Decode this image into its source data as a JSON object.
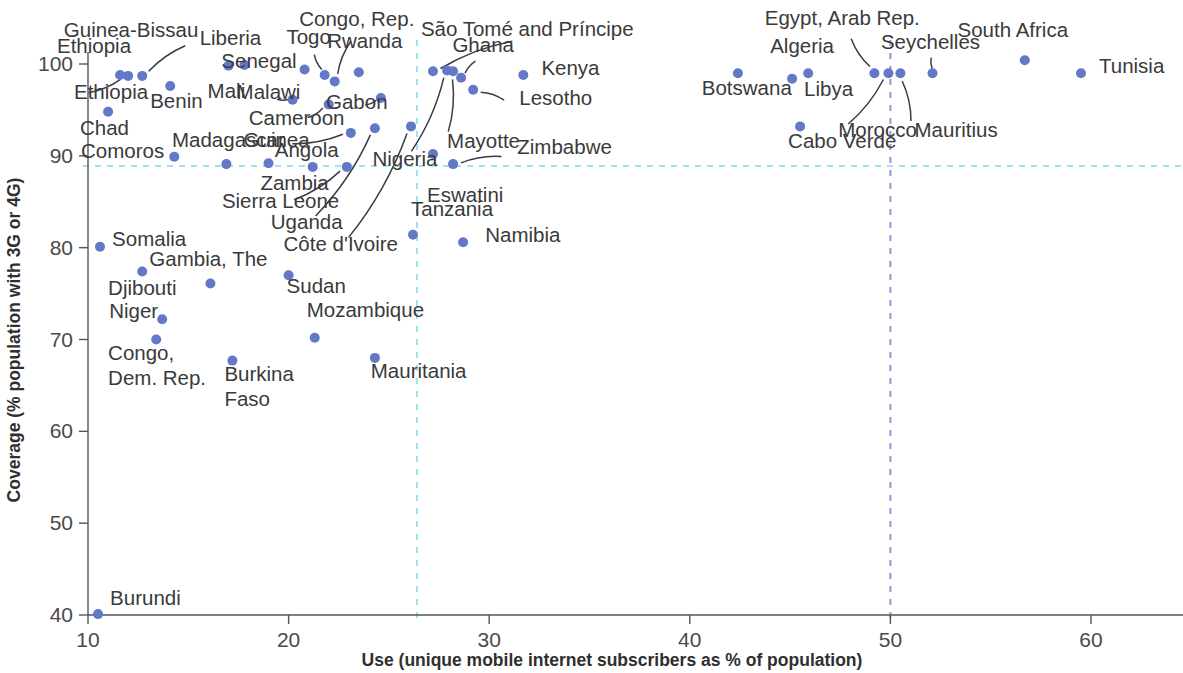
{
  "chart_data": {
    "type": "scatter",
    "title": "",
    "xlabel": "Use (unique mobile internet subscribers as % of population)",
    "ylabel": "Coverage (% population with 3G or 4G)",
    "xlim": [
      9.0,
      65.0
    ],
    "ylim": [
      39.2,
      101.5
    ],
    "xticks": [
      10,
      20,
      30,
      40,
      50,
      60
    ],
    "yticks": [
      40,
      50,
      60,
      70,
      80,
      90,
      100
    ],
    "grid": false,
    "legend": null,
    "marker_color": "#6478c8",
    "reference_lines": [
      {
        "name": "coverage-average",
        "orientation": "horizontal",
        "value": 88.9,
        "color": "#9de2f0",
        "style": "dashed"
      },
      {
        "name": "use-average",
        "orientation": "vertical",
        "value": 26.4,
        "color": "#9de2f0",
        "style": "dashed"
      },
      {
        "name": "use-target",
        "orientation": "vertical",
        "value": 50.0,
        "color": "#8e9ad8",
        "style": "dashed"
      }
    ],
    "points": [
      {
        "label": "Ethiopia",
        "x": 11.6,
        "y": 98.8,
        "lx": 10.3,
        "ly": 101.2,
        "anchor": "mid",
        "leader": false
      },
      {
        "label": "Guinea-Bissau",
        "x": 12.7,
        "y": 98.7,
        "lx": 15.5,
        "ly": 103.0,
        "anchor": "end",
        "leader": true
      },
      {
        "label": "Ethiopia",
        "x": 12.0,
        "y": 98.7,
        "lx": 9.3,
        "ly": 96.2,
        "anchor": "start",
        "leader": true
      },
      {
        "label": "Benin",
        "x": 14.1,
        "y": 97.6,
        "lx": 13.1,
        "ly": 95.2,
        "anchor": "start",
        "leader": false
      },
      {
        "label": "Chad",
        "x": 11.0,
        "y": 94.8,
        "lx": 9.6,
        "ly": 92.3,
        "anchor": "start",
        "leader": false
      },
      {
        "label": "Comoros",
        "x": 14.3,
        "y": 89.9,
        "lx": 13.8,
        "ly": 89.8,
        "anchor": "end",
        "leader": false
      },
      {
        "label": "Madagascar",
        "x": 16.9,
        "y": 89.1,
        "lx": 17.0,
        "ly": 91.0,
        "anchor": "mid",
        "leader": false
      },
      {
        "label": "Liberia",
        "x": 17.0,
        "y": 99.8,
        "lx": 17.1,
        "ly": 102.1,
        "anchor": "mid",
        "leader": false
      },
      {
        "label": "Mali",
        "x": 17.8,
        "y": 99.9,
        "lx": 16.9,
        "ly": 96.3,
        "anchor": "mid",
        "leader": false
      },
      {
        "label": "Senegal",
        "x": 20.8,
        "y": 99.4,
        "lx": 20.4,
        "ly": 99.6,
        "anchor": "end",
        "leader": false
      },
      {
        "label": "Togo",
        "x": 21.8,
        "y": 98.8,
        "lx": 21.0,
        "ly": 102.2,
        "anchor": "mid",
        "leader": true
      },
      {
        "label": "Congo, Rep.",
        "x": 22.3,
        "y": 98.1,
        "lx": 23.4,
        "ly": 104.1,
        "anchor": "mid",
        "leader": true
      },
      {
        "label": "Malawi",
        "x": 20.2,
        "y": 96.1,
        "lx": 19.0,
        "ly": 96.2,
        "anchor": "mid",
        "leader": true
      },
      {
        "label": "Cameroon",
        "x": 22.0,
        "y": 95.6,
        "lx": 20.4,
        "ly": 93.4,
        "anchor": "mid",
        "leader": true
      },
      {
        "label": "Guinea",
        "x": 23.1,
        "y": 92.5,
        "lx": 19.4,
        "ly": 91.0,
        "anchor": "mid",
        "leader": true
      },
      {
        "label": "Angola",
        "x": 19.0,
        "y": 89.2,
        "lx": 20.9,
        "ly": 89.9,
        "anchor": "mid",
        "leader": false
      },
      {
        "label": "Zambia",
        "x": 21.2,
        "y": 88.8,
        "lx": 20.3,
        "ly": 86.3,
        "anchor": "mid",
        "leader": false
      },
      {
        "label": "Sierra Leone",
        "x": 22.9,
        "y": 88.8,
        "lx": 19.6,
        "ly": 84.3,
        "anchor": "mid",
        "leader": true
      },
      {
        "label": "Rwanda",
        "x": 23.5,
        "y": 99.1,
        "lx": 23.8,
        "ly": 101.8,
        "anchor": "mid",
        "leader": false
      },
      {
        "label": "Gabon",
        "x": 24.6,
        "y": 96.3,
        "lx": 23.4,
        "ly": 95.1,
        "anchor": "mid",
        "leader": true
      },
      {
        "label": "Uganda",
        "x": 24.3,
        "y": 93.0,
        "lx": 20.9,
        "ly": 82.0,
        "anchor": "mid",
        "leader": true
      },
      {
        "label": "Côte d'Ivoire",
        "x": 26.1,
        "y": 93.2,
        "lx": 22.6,
        "ly": 79.6,
        "anchor": "mid",
        "leader": true
      },
      {
        "label": "São Tomé and Príncipe",
        "x": 27.2,
        "y": 99.2,
        "lx": 31.9,
        "ly": 103.1,
        "anchor": "mid",
        "leader": true
      },
      {
        "label": "Nigeria",
        "x": 27.9,
        "y": 99.3,
        "lx": 25.8,
        "ly": 88.9,
        "anchor": "mid",
        "leader": true
      },
      {
        "label": "Mayotte",
        "x": 28.2,
        "y": 99.2,
        "lx": 27.9,
        "ly": 90.9,
        "anchor": "start",
        "leader": true
      },
      {
        "label": "Ghana",
        "x": 28.6,
        "y": 98.5,
        "lx": 29.7,
        "ly": 101.3,
        "anchor": "mid",
        "leader": true
      },
      {
        "label": "Lesotho",
        "x": 29.2,
        "y": 97.2,
        "lx": 31.5,
        "ly": 95.5,
        "anchor": "start",
        "leader": true
      },
      {
        "label": "Zimbabwe",
        "x": 28.2,
        "y": 89.1,
        "lx": 31.4,
        "ly": 90.2,
        "anchor": "start",
        "leader": true
      },
      {
        "label": "Eswatini",
        "x": 27.2,
        "y": 90.2,
        "lx": 26.9,
        "ly": 85.0,
        "anchor": "start",
        "leader": false
      },
      {
        "label": "Tanzania",
        "x": 26.2,
        "y": 81.4,
        "lx": 26.1,
        "ly": 83.5,
        "anchor": "start",
        "leader": false
      },
      {
        "label": "Namibia",
        "x": 28.7,
        "y": 80.6,
        "lx": 29.8,
        "ly": 80.6,
        "anchor": "start",
        "leader": false
      },
      {
        "label": "Kenya",
        "x": 31.7,
        "y": 98.8,
        "lx": 32.6,
        "ly": 98.8,
        "anchor": "start",
        "leader": false
      },
      {
        "label": "Somalia",
        "x": 10.6,
        "y": 80.1,
        "lx": 11.2,
        "ly": 80.2,
        "anchor": "start",
        "leader": false
      },
      {
        "label": "Djibouti",
        "x": 12.7,
        "y": 77.4,
        "lx": 11.0,
        "ly": 74.9,
        "anchor": "start",
        "leader": false
      },
      {
        "label": "Gambia, The",
        "x": 16.1,
        "y": 76.1,
        "lx": 16.0,
        "ly": 78.0,
        "anchor": "mid",
        "leader": false
      },
      {
        "label": "Niger",
        "x": 13.7,
        "y": 72.2,
        "lx": 13.5,
        "ly": 72.3,
        "anchor": "end",
        "leader": false
      },
      {
        "label": "Congo, Dem. Rep.",
        "x": 13.4,
        "y": 70.0,
        "lx": 11.0,
        "ly": 67.8,
        "anchor": "start",
        "leader": false
      },
      {
        "label": "Burkina Faso",
        "x": 17.2,
        "y": 67.7,
        "lx": 16.8,
        "ly": 65.5,
        "anchor": "start",
        "leader": false
      },
      {
        "label": "Sudan",
        "x": 20.0,
        "y": 77.0,
        "lx": 19.9,
        "ly": 75.1,
        "anchor": "start",
        "leader": false
      },
      {
        "label": "Mozambique",
        "x": 21.3,
        "y": 70.2,
        "lx": 20.9,
        "ly": 72.5,
        "anchor": "start",
        "leader": false
      },
      {
        "label": "Mauritania",
        "x": 24.3,
        "y": 68.0,
        "lx": 24.1,
        "ly": 65.8,
        "anchor": "start",
        "leader": false
      },
      {
        "label": "Burundi",
        "x": 10.5,
        "y": 40.1,
        "lx": 11.1,
        "ly": 41.1,
        "anchor": "start",
        "leader": false
      },
      {
        "label": "Botswana",
        "x": 42.4,
        "y": 99.0,
        "lx": 40.6,
        "ly": 96.6,
        "anchor": "start",
        "leader": false
      },
      {
        "label": "Algeria",
        "x": 45.9,
        "y": 99.0,
        "lx": 45.6,
        "ly": 101.2,
        "anchor": "mid",
        "leader": false
      },
      {
        "label": "Libya",
        "x": 45.1,
        "y": 98.4,
        "lx": 45.7,
        "ly": 96.5,
        "anchor": "start",
        "leader": false
      },
      {
        "label": "Cabo Verde",
        "x": 45.5,
        "y": 93.2,
        "lx": 44.9,
        "ly": 90.9,
        "anchor": "start",
        "leader": false
      },
      {
        "label": "Egypt, Arab Rep.",
        "x": 49.2,
        "y": 99.0,
        "lx": 47.6,
        "ly": 104.2,
        "anchor": "mid",
        "leader": true
      },
      {
        "label": "Morocco",
        "x": 49.9,
        "y": 99.0,
        "lx": 47.4,
        "ly": 92.1,
        "anchor": "start",
        "leader": true
      },
      {
        "label": "Mauritius",
        "x": 50.5,
        "y": 99.0,
        "lx": 51.2,
        "ly": 92.1,
        "anchor": "start",
        "leader": true
      },
      {
        "label": "Seychelles",
        "x": 52.1,
        "y": 99.0,
        "lx": 52.0,
        "ly": 101.6,
        "anchor": "mid",
        "leader": true
      },
      {
        "label": "South Africa",
        "x": 56.7,
        "y": 100.4,
        "lx": 56.1,
        "ly": 103.0,
        "anchor": "mid",
        "leader": false
      },
      {
        "label": "Tunisia",
        "x": 59.5,
        "y": 99.0,
        "lx": 60.4,
        "ly": 99.0,
        "anchor": "start",
        "leader": false
      }
    ]
  }
}
